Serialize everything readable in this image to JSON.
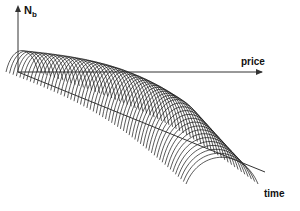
{
  "chart_data": {
    "type": "surface-waterfall",
    "title": "",
    "axes": {
      "z": {
        "label": "N",
        "subscript": "b"
      },
      "x": {
        "label": "price"
      },
      "y": {
        "label": "time"
      }
    },
    "series_count": 60,
    "grid": false,
    "legend": null
  },
  "labels": {
    "nb_main": "N",
    "nb_sub": "b",
    "price": "price",
    "time": "time"
  },
  "colors": {
    "line": "#111111",
    "background": "#ffffff"
  }
}
